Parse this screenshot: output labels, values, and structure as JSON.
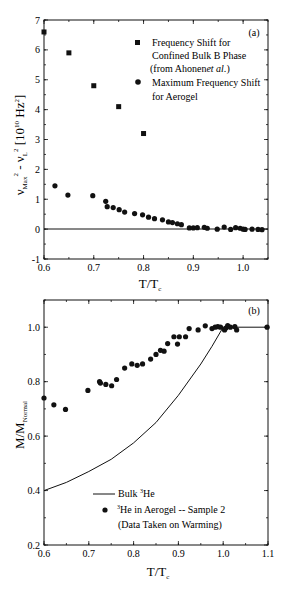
{
  "chart_data": [
    {
      "panel": "(a)",
      "type": "scatter",
      "xlabel": "T/Tc",
      "ylabel": "νMax² - νL² [10¹⁰ Hz²]",
      "xlim": [
        0.6,
        1.05
      ],
      "ylim": [
        -1,
        7
      ],
      "xticks": [
        "0.6",
        "0.7",
        "0.8",
        "0.9",
        "1.0"
      ],
      "yticks": [
        "-1",
        "0",
        "1",
        "2",
        "3",
        "4",
        "5",
        "6",
        "7"
      ],
      "grid": false,
      "legend_position": "upper right",
      "reference_line": {
        "y": 0
      },
      "series": [
        {
          "name": "Frequency Shift for Confined Bulk B Phase (from Ahonen et al.)",
          "marker": "square",
          "points": [
            [
              0.6,
              6.6
            ],
            [
              0.65,
              5.9
            ],
            [
              0.7,
              4.8
            ],
            [
              0.75,
              4.1
            ],
            [
              0.8,
              3.2
            ]
          ]
        },
        {
          "name": "Maximum Frequency Shift for Aerogel",
          "marker": "circle",
          "points": [
            [
              0.622,
              1.45
            ],
            [
              0.648,
              1.14
            ],
            [
              0.698,
              1.12
            ],
            [
              0.724,
              0.93
            ],
            [
              0.727,
              0.75
            ],
            [
              0.739,
              0.72
            ],
            [
              0.751,
              0.65
            ],
            [
              0.762,
              0.57
            ],
            [
              0.782,
              0.52
            ],
            [
              0.798,
              0.48
            ],
            [
              0.81,
              0.4
            ],
            [
              0.822,
              0.35
            ],
            [
              0.838,
              0.31
            ],
            [
              0.85,
              0.24
            ],
            [
              0.858,
              0.22
            ],
            [
              0.868,
              0.18
            ],
            [
              0.876,
              0.15
            ],
            [
              0.892,
              0.04
            ],
            [
              0.9,
              0.04
            ],
            [
              0.908,
              0.05
            ],
            [
              0.922,
              0.06
            ],
            [
              0.928,
              0.03
            ],
            [
              0.948,
              0.0
            ],
            [
              0.962,
              0.07
            ],
            [
              0.975,
              -0.01
            ],
            [
              0.985,
              0.05
            ],
            [
              0.994,
              0.03
            ],
            [
              1.0,
              0.0
            ],
            [
              1.004,
              -0.01
            ],
            [
              1.018,
              0.0
            ],
            [
              1.03,
              -0.01
            ],
            [
              1.038,
              -0.02
            ]
          ]
        }
      ]
    },
    {
      "panel": "(b)",
      "type": "scatter",
      "xlabel": "T/Tc",
      "ylabel": "M/M_Normal",
      "xlim": [
        0.6,
        1.1
      ],
      "ylim": [
        0.2,
        1.1
      ],
      "xticks": [
        "0.6",
        "0.7",
        "0.8",
        "0.9",
        "1.0",
        "1.1"
      ],
      "yticks": [
        "0.2",
        "0.4",
        "0.6",
        "0.8",
        "1.0"
      ],
      "grid": false,
      "legend_position": "lower center",
      "series": [
        {
          "name": "Bulk ³He",
          "marker": "line",
          "points": [
            [
              0.6,
              0.4
            ],
            [
              0.65,
              0.43
            ],
            [
              0.7,
              0.47
            ],
            [
              0.75,
              0.515
            ],
            [
              0.8,
              0.575
            ],
            [
              0.85,
              0.65
            ],
            [
              0.9,
              0.75
            ],
            [
              0.95,
              0.865
            ],
            [
              0.975,
              0.93
            ],
            [
              1.0,
              1.0
            ],
            [
              1.1,
              1.0
            ]
          ]
        },
        {
          "name": "³He in Aerogel -- Sample 2 (Data Taken on Warming)",
          "marker": "circle",
          "points": [
            [
              0.6,
              0.74
            ],
            [
              0.622,
              0.715
            ],
            [
              0.648,
              0.698
            ],
            [
              0.698,
              0.768
            ],
            [
              0.724,
              0.8
            ],
            [
              0.726,
              0.795
            ],
            [
              0.738,
              0.79
            ],
            [
              0.751,
              0.785
            ],
            [
              0.762,
              0.808
            ],
            [
              0.78,
              0.85
            ],
            [
              0.796,
              0.865
            ],
            [
              0.808,
              0.86
            ],
            [
              0.82,
              0.865
            ],
            [
              0.838,
              0.883
            ],
            [
              0.85,
              0.9
            ],
            [
              0.86,
              0.915
            ],
            [
              0.868,
              0.912
            ],
            [
              0.876,
              0.94
            ],
            [
              0.89,
              0.965
            ],
            [
              0.898,
              0.938
            ],
            [
              0.902,
              0.965
            ],
            [
              0.916,
              0.965
            ],
            [
              0.924,
              0.995
            ],
            [
              0.944,
              0.99
            ],
            [
              0.96,
              1.005
            ],
            [
              0.975,
              0.995
            ],
            [
              0.982,
              1.0
            ],
            [
              0.988,
              1.002
            ],
            [
              0.994,
              1.0
            ],
            [
              1.003,
              0.99
            ],
            [
              1.006,
              0.997
            ],
            [
              1.01,
              1.006
            ],
            [
              1.016,
              1.0
            ],
            [
              1.026,
              1.002
            ],
            [
              1.03,
              0.99
            ],
            [
              1.098,
              1.0
            ]
          ]
        }
      ]
    }
  ],
  "panel_a": {
    "label": "(a)",
    "legend": {
      "square_line1": "Frequency Shift for",
      "square_line2": "Confined Bulk B Phase",
      "square_line3": "(from Ahonen",
      "square_line3_italic": "et al.",
      "square_line3_end": ")",
      "circle_line1": "Maximum Frequency Shift",
      "circle_line2": "for Aerogel"
    },
    "ylabel_main": "ν",
    "ylabel_sub1": "Max",
    "ylabel_sup": "2",
    "ylabel_mid": " - ν",
    "ylabel_sub2": "L",
    "ylabel_units": " [10",
    "ylabel_units_sup": "10",
    "ylabel_units_end": " Hz",
    "ylabel_units_sup2": "2",
    "ylabel_close": "]",
    "xlabel_main": "T/T",
    "xlabel_sub": "c",
    "yticks": [
      "-1",
      "0",
      "1",
      "2",
      "3",
      "4",
      "5",
      "6",
      "7"
    ],
    "xticks": [
      "0.6",
      "0.7",
      "0.8",
      "0.9",
      "1.0"
    ]
  },
  "panel_b": {
    "label": "(b)",
    "legend": {
      "line_label_pre": "Bulk ",
      "line_label_sup": "3",
      "line_label_post": "He",
      "dot_label_sup": "3",
      "dot_label_line1": "He in Aerogel -- Sample 2",
      "dot_label_line2": "(Data Taken on Warming)"
    },
    "ylabel_main": "M/M",
    "ylabel_sub": "Normal",
    "xlabel_main": "T/T",
    "xlabel_sub": "c",
    "yticks": [
      "0.2",
      "0.4",
      "0.6",
      "0.8",
      "1.0"
    ],
    "xticks": [
      "0.6",
      "0.7",
      "0.8",
      "0.9",
      "1.0",
      "1.1"
    ]
  }
}
